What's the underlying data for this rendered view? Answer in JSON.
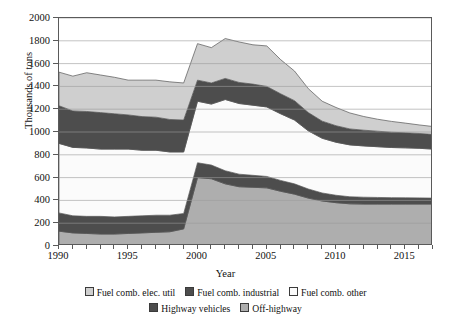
{
  "chart_data": {
    "type": "area",
    "stacked": true,
    "title": "",
    "xlabel": "Year",
    "ylabel": "Thousands of tons",
    "xlim": [
      1990,
      2017
    ],
    "ylim": [
      0,
      2000
    ],
    "yticks": [
      0,
      200,
      400,
      600,
      800,
      1000,
      1200,
      1400,
      1600,
      1800,
      2000
    ],
    "xticks_major": [
      1990,
      1995,
      2000,
      2005,
      2010,
      2015
    ],
    "xticks_minor_step": 1,
    "grid": "horizontal",
    "legend_position": "bottom",
    "x": [
      1990,
      1991,
      1992,
      1993,
      1994,
      1995,
      1996,
      1997,
      1998,
      1999,
      2000,
      2001,
      2002,
      2003,
      2004,
      2005,
      2006,
      2007,
      2008,
      2009,
      2010,
      2011,
      2012,
      2013,
      2014,
      2015,
      2016,
      2017
    ],
    "series": [
      {
        "name": "Off-highway",
        "color": "#aeaeae",
        "values": [
          130,
          115,
          110,
          105,
          105,
          110,
          115,
          120,
          125,
          150,
          600,
          590,
          545,
          520,
          515,
          510,
          480,
          455,
          420,
          395,
          380,
          370,
          368,
          368,
          368,
          368,
          368,
          368
        ]
      },
      {
        "name": "Highway vehicles",
        "color": "#4d4d4d",
        "values": [
          160,
          150,
          150,
          155,
          150,
          150,
          150,
          150,
          145,
          135,
          130,
          120,
          115,
          110,
          105,
          100,
          95,
          90,
          80,
          70,
          65,
          62,
          60,
          58,
          56,
          55,
          54,
          52
        ]
      },
      {
        "name": "Fuel comb. other",
        "color": "#fbfbfb",
        "values": [
          610,
          600,
          600,
          590,
          595,
          590,
          575,
          570,
          555,
          540,
          540,
          535,
          625,
          620,
          615,
          610,
          585,
          560,
          510,
          480,
          465,
          455,
          450,
          445,
          440,
          438,
          435,
          430
        ]
      },
      {
        "name": "Fuel comb. industrial",
        "color": "#4d4d4d",
        "values": [
          330,
          320,
          320,
          320,
          310,
          300,
          295,
          290,
          285,
          280,
          185,
          185,
          185,
          185,
          185,
          180,
          175,
          170,
          160,
          150,
          145,
          140,
          138,
          136,
          134,
          132,
          130,
          128
        ]
      },
      {
        "name": "Fuel comb. elec. util",
        "color": "#cfcfcf",
        "values": [
          295,
          305,
          340,
          330,
          320,
          305,
          320,
          325,
          330,
          325,
          320,
          310,
          350,
          355,
          345,
          355,
          300,
          260,
          210,
          175,
          160,
          140,
          120,
          105,
          95,
          85,
          75,
          70
        ]
      }
    ],
    "stack_totals_note": "Bands are drawn bottom-to-top in series order."
  },
  "axes": {
    "ylabel": "Thousands of tons",
    "xlabel": "Year",
    "ytick_labels": [
      "0",
      "200",
      "400",
      "600",
      "800",
      "1000",
      "1200",
      "1400",
      "1600",
      "1800",
      "2000"
    ],
    "xtick_labels": [
      "1990",
      "1995",
      "2000",
      "2005",
      "2010",
      "2015"
    ]
  },
  "legend": {
    "row1": [
      {
        "label": "Fuel comb. elec. util",
        "color": "#cfcfcf"
      },
      {
        "label": "Fuel comb. industrial",
        "color": "#4d4d4d"
      },
      {
        "label": "Fuel comb. other",
        "color": "#fbfbfb"
      }
    ],
    "row2": [
      {
        "label": "Highway vehicles",
        "color": "#4d4d4d"
      },
      {
        "label": "Off-highway",
        "color": "#aeaeae"
      }
    ]
  },
  "style": {
    "frame_color": "#5a5a5a",
    "grid_color": "#9a9a9a",
    "band_outline": "#555555"
  }
}
